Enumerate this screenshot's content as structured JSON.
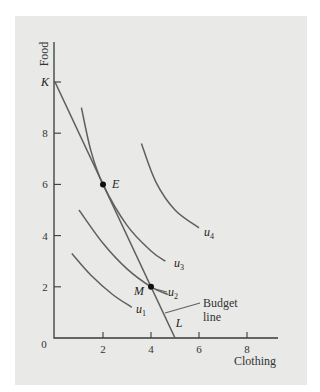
{
  "chart_data": {
    "type": "line",
    "title": "",
    "xlabel": "Clothing",
    "ylabel": "Food",
    "xlim": [
      0,
      9.5
    ],
    "ylim": [
      0,
      12
    ],
    "grid": false,
    "x_ticks": [
      {
        "value": 0,
        "label": "0"
      },
      {
        "value": 2,
        "label": "2"
      },
      {
        "value": 4,
        "label": "4"
      },
      {
        "value": 6,
        "label": "6"
      },
      {
        "value": 8,
        "label": "8"
      }
    ],
    "y_ticks": [
      {
        "value": 2,
        "label": "2"
      },
      {
        "value": 4,
        "label": "4"
      },
      {
        "value": 6,
        "label": "6"
      },
      {
        "value": 8,
        "label": "8"
      },
      {
        "value": 10,
        "label": "K"
      }
    ],
    "budget_line": {
      "name": "Budget line",
      "label_lines": [
        "Budget",
        "line"
      ],
      "points": [
        {
          "x": 0,
          "y": 10,
          "label": "K"
        },
        {
          "x": 5,
          "y": 0,
          "label": "L"
        }
      ]
    },
    "series": [
      {
        "name": "u1",
        "label": "u",
        "subscript": "1",
        "points": [
          [
            0.7,
            3.3
          ],
          [
            1.5,
            2.45
          ],
          [
            2.4,
            1.7
          ],
          [
            3.2,
            1.2
          ]
        ]
      },
      {
        "name": "u2",
        "label": "u",
        "subscript": "2",
        "points": [
          [
            1.0,
            5.0
          ],
          [
            2.0,
            3.7
          ],
          [
            3.0,
            2.7
          ],
          [
            4.0,
            2.0
          ],
          [
            4.7,
            1.7
          ]
        ]
      },
      {
        "name": "u3",
        "label": "u",
        "subscript": "3",
        "points": [
          [
            1.1,
            9.0
          ],
          [
            1.5,
            7.3
          ],
          [
            2.0,
            6.0
          ],
          [
            3.0,
            4.4
          ],
          [
            4.0,
            3.4
          ],
          [
            4.6,
            3.0
          ]
        ]
      },
      {
        "name": "u4",
        "label": "u",
        "subscript": "4",
        "points": [
          [
            3.6,
            7.6
          ],
          [
            4.2,
            6.1
          ],
          [
            5.0,
            5.0
          ],
          [
            6.0,
            4.3
          ]
        ]
      }
    ],
    "points": [
      {
        "name": "E",
        "x": 2,
        "y": 6
      },
      {
        "name": "M",
        "x": 4,
        "y": 2
      }
    ],
    "origin_label": "0"
  }
}
